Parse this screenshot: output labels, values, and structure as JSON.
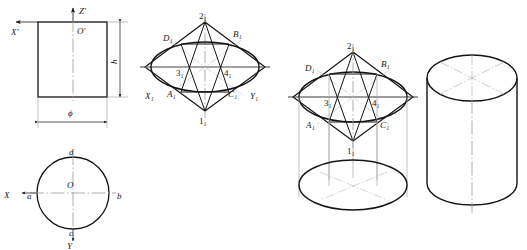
{
  "drawing": {
    "title": "Isometric projection construction of a cylinder (four-centre ellipse method)",
    "stroke_color": "#141414",
    "thin_color": "#8a8a8a",
    "centerline_color": "#9a9a9a",
    "background": "#ffffff"
  },
  "view_front": {
    "name": "front-view-rectangle",
    "axis_z_label": "Z'",
    "axis_x_label": "X'",
    "origin_label": "O'",
    "dim_height_label": "h",
    "dim_diameter_label": "ϕ"
  },
  "view_top": {
    "name": "top-view-circle",
    "center_label": "O",
    "axis_x_label": "X",
    "axis_y_label": "Y",
    "point_left_label": "a",
    "point_right_label": "b",
    "point_bottom_label": "c",
    "point_top_label": "d"
  },
  "view_iso_ellipse": {
    "name": "isometric-ellipse-construction",
    "axis_x_label": "X₁",
    "axis_y_label": "Y₁",
    "vertex_top_label": "2₁",
    "vertex_bottom_label": "1₁",
    "point_d_label": "D₁",
    "point_b_label": "B₁",
    "point_a_label": "A₁",
    "point_c_label": "C₁",
    "center_3_label": "3₁",
    "center_4_label": "4₁"
  },
  "view_iso_solid": {
    "name": "isometric-cylinder-construction",
    "vertex_top_label": "2₁",
    "vertex_bottom_label": "1₁",
    "point_d_label": "D₁",
    "point_b_label": "B₁",
    "point_a_label": "A₁",
    "point_c_label": "C₁",
    "center_3_label": "3₁",
    "center_4_label": "4₁"
  },
  "view_result": {
    "name": "finished-isometric-cylinder"
  }
}
